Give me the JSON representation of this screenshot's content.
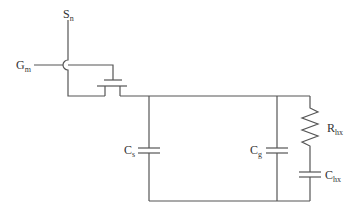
{
  "diagram": {
    "type": "circuit-schematic",
    "labels": {
      "source": {
        "main": "S",
        "sub": "n"
      },
      "gate": {
        "main": "G",
        "sub": "m"
      },
      "cs": {
        "main": "C",
        "sub": "s"
      },
      "cg": {
        "main": "C",
        "sub": "g"
      },
      "rhx": {
        "main": "R",
        "sub": "hx"
      },
      "chx": {
        "main": "C",
        "sub": "hx"
      }
    },
    "components": [
      {
        "id": "transistor",
        "kind": "mosfet"
      },
      {
        "id": "Cs",
        "kind": "capacitor"
      },
      {
        "id": "Cg",
        "kind": "capacitor"
      },
      {
        "id": "Rhx",
        "kind": "resistor"
      },
      {
        "id": "Chx",
        "kind": "capacitor"
      }
    ],
    "colors": {
      "wire": "#555555",
      "text": "#333333",
      "background": "#ffffff"
    }
  }
}
